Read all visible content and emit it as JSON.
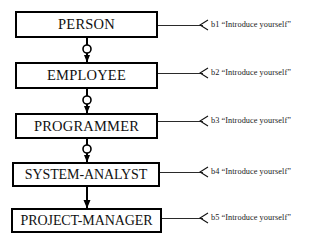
{
  "diagram": {
    "type": "sequence-inheritance-chain",
    "title": "",
    "nodes": [
      {
        "id": "n1",
        "label": "PERSON"
      },
      {
        "id": "n2",
        "label": "EMPLOYEE"
      },
      {
        "id": "n3",
        "label": "PROGRAMMER"
      },
      {
        "id": "n4",
        "label": "SYSTEM-ANALYST"
      },
      {
        "id": "n5",
        "label": "PROJECT-MANAGER"
      }
    ],
    "messages": [
      {
        "id": "b1",
        "tag": "b1",
        "text": "“Introduce yourself”",
        "full": "b1  “Introduce yourself”"
      },
      {
        "id": "b2",
        "tag": "b2",
        "text": "“Introduce yourself”",
        "full": "b2  “Introduce yourself”"
      },
      {
        "id": "b3",
        "tag": "b3",
        "text": "“Introduce yourself”",
        "full": "b3  “Introduce yourself”"
      },
      {
        "id": "b4",
        "tag": "b4",
        "text": "“Introduce yourself”",
        "full": "b4  “Introduce yourself”"
      },
      {
        "id": "b5",
        "tag": "b5",
        "text": "“Introduce yourself”",
        "full": "b5  “Introduce yourself”"
      }
    ],
    "connectors": [
      {
        "from": "n1",
        "to": "n2",
        "style": "arrow-with-ring"
      },
      {
        "from": "n2",
        "to": "n3",
        "style": "arrow-with-ring"
      },
      {
        "from": "n3",
        "to": "n4",
        "style": "arrow-with-ring"
      },
      {
        "from": "n4",
        "to": "n5",
        "style": "arrow-plain"
      }
    ],
    "colors": {
      "stroke": "#000000",
      "background": "#ffffff",
      "text": "#111111",
      "label_text": "#1a1a1a"
    }
  }
}
